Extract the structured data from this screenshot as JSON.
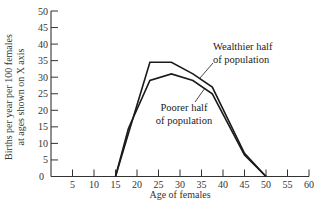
{
  "chart_data": {
    "type": "line",
    "title": "",
    "xlabel": "Age of females",
    "ylabel_lines": [
      "Births per year per 100 females",
      "at ages shown on X axis"
    ],
    "xlim": [
      0,
      60
    ],
    "ylim": [
      0,
      50
    ],
    "x_ticks": [
      5,
      10,
      15,
      20,
      25,
      30,
      35,
      40,
      45,
      50,
      55,
      60
    ],
    "y_ticks": [
      0,
      5,
      10,
      15,
      20,
      25,
      30,
      35,
      40,
      45,
      50
    ],
    "origin_label": "0",
    "grid": false,
    "legend": "none (inline annotations)",
    "series": [
      {
        "name": "Wealthier half of population",
        "label_lines": [
          "Wealthier half",
          "of population"
        ],
        "x": [
          15,
          18,
          23,
          28,
          33,
          37.5,
          45,
          50
        ],
        "y": [
          0,
          13,
          34.5,
          34.5,
          31,
          27,
          7,
          0
        ]
      },
      {
        "name": "Poorer half of population",
        "label_lines": [
          "Poorer half",
          "of population"
        ],
        "x": [
          15,
          18,
          23,
          28,
          33,
          37.5,
          45,
          50
        ],
        "y": [
          0,
          14.5,
          29,
          31,
          29,
          25,
          6.5,
          0
        ]
      }
    ],
    "colors": {
      "line": "#1a1a1a",
      "axis": "#333333"
    }
  }
}
